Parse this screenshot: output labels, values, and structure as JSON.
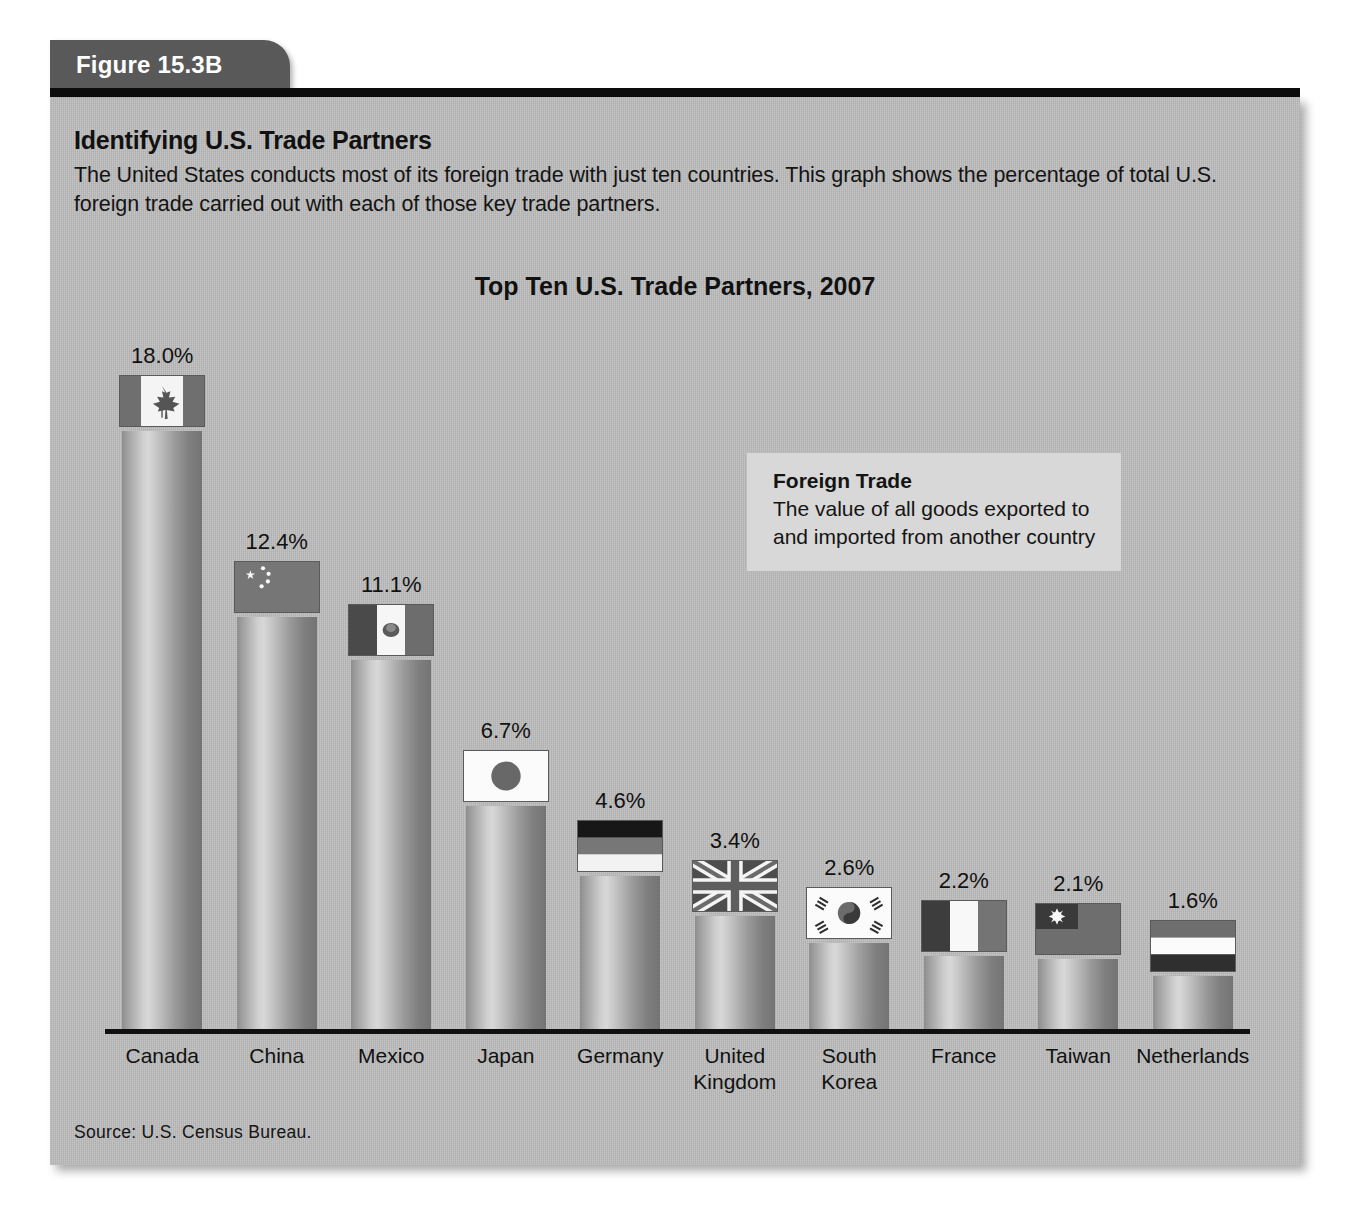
{
  "figure": {
    "tab_label": "Figure 15.3B",
    "title": "Identifying U.S. Trade Partners",
    "description": "The United States conducts most of its foreign trade with just ten countries. This graph shows the percentage of total U.S. foreign trade carried out with each of those key trade partners.",
    "source": "Source: U.S. Census Bureau."
  },
  "definition": {
    "term": "Foreign Trade",
    "text": "The value of all goods exported to and imported from another country"
  },
  "colors": {
    "panel_background": "#b9b9b9",
    "tab_background": "#595959",
    "rule": "#0c0c0c",
    "definition_background": "#d8d8d8",
    "axis": "#101010",
    "text": "#111111"
  },
  "chart_data": {
    "type": "bar",
    "title": "Top Ten U.S. Trade Partners, 2007",
    "xlabel": "",
    "ylabel": "",
    "ylim": [
      0,
      18.0
    ],
    "grid": false,
    "legend": "none",
    "value_suffix": "%",
    "categories": [
      "Canada",
      "China",
      "Mexico",
      "Japan",
      "Germany",
      "United Kingdom",
      "South Korea",
      "France",
      "Taiwan",
      "Netherlands"
    ],
    "values": [
      18.0,
      12.4,
      11.1,
      6.7,
      4.6,
      3.4,
      2.6,
      2.2,
      2.1,
      1.6
    ],
    "value_labels": [
      "18.0%",
      "12.4%",
      "11.1%",
      "6.7%",
      "4.6%",
      "3.4%",
      "2.6%",
      "2.2%",
      "2.1%",
      "1.6%"
    ],
    "tick_labels": [
      [
        "Canada"
      ],
      [
        "China"
      ],
      [
        "Mexico"
      ],
      [
        "Japan"
      ],
      [
        "Germany"
      ],
      [
        "United",
        "Kingdom"
      ],
      [
        "South",
        "Korea"
      ],
      [
        "France"
      ],
      [
        "Taiwan"
      ],
      [
        "Netherlands"
      ]
    ],
    "flag_icons": [
      "flag-canada-icon",
      "flag-china-icon",
      "flag-mexico-icon",
      "flag-japan-icon",
      "flag-germany-icon",
      "flag-united-kingdom-icon",
      "flag-south-korea-icon",
      "flag-france-icon",
      "flag-taiwan-icon",
      "flag-netherlands-icon"
    ]
  }
}
